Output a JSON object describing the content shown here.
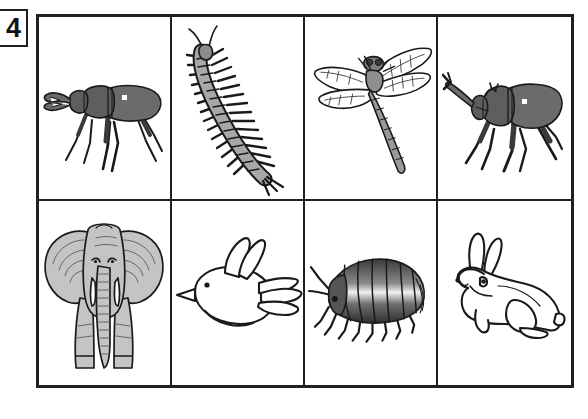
{
  "worksheet": {
    "question_number": "4",
    "layout": {
      "rows": 2,
      "columns": 4
    },
    "background_color": "#ffffff",
    "line_color": "#231f20"
  },
  "cells": [
    {
      "position": "row1-col1",
      "icon_name": "stag-beetle-illustration",
      "label": "stag beetle",
      "group": "insect",
      "orientation": "side view facing left",
      "fill_color": "#6b6b6b",
      "outline_color": "#1a1a1a"
    },
    {
      "position": "row1-col2",
      "icon_name": "centipede-illustration",
      "label": "centipede",
      "group": "myriapod",
      "orientation": "diagonal, head upper-left",
      "fill_color": "#a8a8a8",
      "outline_color": "#1a1a1a"
    },
    {
      "position": "row1-col3",
      "icon_name": "dragonfly-illustration",
      "label": "dragonfly",
      "group": "insect",
      "orientation": "four wings spread, body angled down-right",
      "fill_color": "#8f8f8f",
      "outline_color": "#1a1a1a"
    },
    {
      "position": "row1-col4",
      "icon_name": "rhinoceros-beetle-illustration",
      "label": "rhinoceros beetle",
      "group": "insect",
      "orientation": "side view, horn pointing left",
      "fill_color": "#6b6b6b",
      "outline_color": "#1a1a1a"
    },
    {
      "position": "row2-col1",
      "icon_name": "elephant-illustration",
      "label": "elephant",
      "group": "mammal",
      "orientation": "front view",
      "fill_color": "#c4c4c4",
      "outline_color": "#1a1a1a"
    },
    {
      "position": "row2-col2",
      "icon_name": "bird-illustration",
      "label": "bird",
      "group": "bird",
      "orientation": "flying, facing left",
      "fill_color": "#ffffff",
      "outline_color": "#1a1a1a"
    },
    {
      "position": "row2-col3",
      "icon_name": "pill-bug-illustration",
      "label": "pill bug",
      "group": "crustacean",
      "orientation": "side view facing left",
      "fill_color": "#707070",
      "outline_color": "#1a1a1a"
    },
    {
      "position": "row2-col4",
      "icon_name": "rabbit-illustration",
      "label": "rabbit",
      "group": "mammal",
      "orientation": "sitting, facing left",
      "fill_color": "#ffffff",
      "outline_color": "#1a1a1a"
    }
  ]
}
